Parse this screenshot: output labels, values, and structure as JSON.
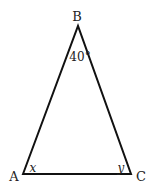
{
  "diagram": {
    "type": "triangle",
    "vertices": {
      "A": {
        "label": "A",
        "x": 23,
        "y": 174
      },
      "B": {
        "label": "B",
        "x": 78,
        "y": 26
      },
      "C": {
        "label": "C",
        "x": 131,
        "y": 174
      }
    },
    "angles": {
      "B": "40°",
      "A": "x",
      "C": "y"
    },
    "colors": {
      "stroke": "#111111",
      "text": "#222222",
      "background": "#ffffff"
    }
  }
}
